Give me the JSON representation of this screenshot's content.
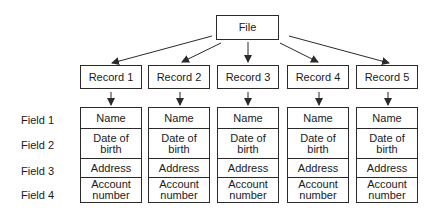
{
  "file": {
    "label": "File"
  },
  "records": [
    {
      "label": "Record 1",
      "fields": [
        "Name",
        "Date of\nbirth",
        "Address",
        "Account\nnumber"
      ]
    },
    {
      "label": "Record 2",
      "fields": [
        "Name",
        "Date of\nbirth",
        "Address",
        "Account\nnumber"
      ]
    },
    {
      "label": "Record 3",
      "fields": [
        "Name",
        "Date of\nbirth",
        "Address",
        "Account\nnumber"
      ]
    },
    {
      "label": "Record 4",
      "fields": [
        "Name",
        "Date of\nbirth",
        "Address",
        "Account\nnumber"
      ]
    },
    {
      "label": "Record 5",
      "fields": [
        "Name",
        "Date of\nbirth",
        "Address",
        "Account\nnumber"
      ]
    }
  ],
  "field_labels": [
    "Field 1",
    "Field 2",
    "Field 3",
    "Field 4"
  ],
  "colors": {
    "line": "#2a2a2a",
    "background": "#ffffff",
    "text": "#1a1a1a"
  }
}
